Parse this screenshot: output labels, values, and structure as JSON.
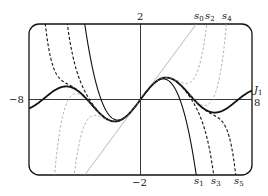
{
  "chart_data": {
    "type": "line",
    "title": "",
    "xlabel": "",
    "ylabel": "",
    "xlim": [
      -8,
      8
    ],
    "ylim": [
      -2,
      2
    ],
    "grid": false,
    "axes_through_origin": true,
    "tick_labels": {
      "x_left": "−8",
      "x_right": "8",
      "y_top": "2",
      "y_bottom": "−2"
    },
    "series": [
      {
        "name": "J1",
        "label": "J",
        "sub": "1",
        "function": "Bessel J1(x)",
        "style": "solid-thick",
        "color": "#111111"
      },
      {
        "name": "s0",
        "label": "s",
        "sub": "0",
        "coeffs_odd_powers": [
          0.5
        ],
        "style": "solid-thin",
        "color": "#9a9a9a"
      },
      {
        "name": "s1",
        "label": "s",
        "sub": "1",
        "coeffs_odd_powers": [
          0.5,
          -0.0625
        ],
        "style": "solid",
        "color": "#111111"
      },
      {
        "name": "s2",
        "label": "s",
        "sub": "2",
        "coeffs_odd_powers": [
          0.5,
          -0.0625,
          0.0026041667
        ],
        "style": "dashed-thin",
        "color": "#9a9a9a"
      },
      {
        "name": "s3",
        "label": "s",
        "sub": "3",
        "coeffs_odd_powers": [
          0.5,
          -0.0625,
          0.0026041667,
          -5.42535e-05
        ],
        "style": "dashed",
        "color": "#111111"
      },
      {
        "name": "s4",
        "label": "s",
        "sub": "4",
        "coeffs_odd_powers": [
          0.5,
          -0.0625,
          0.0026041667,
          -5.42535e-05,
          6.78168e-07
        ],
        "style": "dashed-thin",
        "color": "#9a9a9a"
      },
      {
        "name": "s5",
        "label": "s",
        "sub": "5",
        "coeffs_odd_powers": [
          0.5,
          -0.0625,
          0.0026041667,
          -5.42535e-05,
          6.78168e-07,
          -5.6514e-09
        ],
        "style": "dashed",
        "color": "#111111"
      }
    ],
    "annotations": [
      {
        "text": "s0",
        "position": "top",
        "x_approx": 4.0
      },
      {
        "text": "s2",
        "position": "top",
        "x_approx": 5.6
      },
      {
        "text": "s4",
        "position": "top",
        "x_approx": 6.9
      },
      {
        "text": "s1",
        "position": "bottom",
        "x_approx": 4.0
      },
      {
        "text": "s3",
        "position": "bottom",
        "x_approx": 5.4
      },
      {
        "text": "s5",
        "position": "bottom",
        "x_approx": 7.0
      },
      {
        "text": "J1",
        "position": "right",
        "y_approx": 0.4
      }
    ]
  },
  "labels": {
    "y_top": "2",
    "y_bottom": "−2",
    "x_left": "−8",
    "x_right": "8",
    "s": "s",
    "J": "J",
    "sub0": "0",
    "sub1": "1",
    "sub2": "2",
    "sub3": "3",
    "sub4": "4",
    "sub5": "5"
  }
}
